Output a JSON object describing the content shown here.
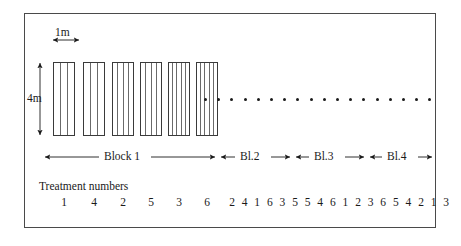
{
  "figure": {
    "scale_labels": {
      "plot_width": "1m",
      "plot_height": "4m"
    },
    "treatment_caption": "Treatment numbers",
    "blocks": [
      {
        "label": "Block 1",
        "treatments": [
          "1",
          "4",
          "2",
          "5",
          "3",
          "6"
        ]
      },
      {
        "label": "Bl.2",
        "treatments": [
          "2",
          "4",
          "1",
          "6",
          "3",
          "5"
        ]
      },
      {
        "label": "Bl.3",
        "treatments": [
          "5",
          "4",
          "6",
          "1",
          "2",
          "3"
        ]
      },
      {
        "label": "Bl.4",
        "treatments": [
          "6",
          "5",
          "4",
          "2",
          "1",
          "3"
        ]
      }
    ],
    "plots": [
      {
        "treatment": "1",
        "rows": 3
      },
      {
        "treatment": "4",
        "rows": 3
      },
      {
        "treatment": "2",
        "rows": 4
      },
      {
        "treatment": "5",
        "rows": 4
      },
      {
        "treatment": "3",
        "rows": 5
      },
      {
        "treatment": "6",
        "rows": 5
      }
    ],
    "continuation_dots": 18,
    "colors": {
      "border": "#4a4a4a",
      "plot_outline": "#3a3a3a",
      "row_line": "#6a6a6a",
      "text": "#1a1a1a",
      "background": "#ffffff"
    }
  }
}
